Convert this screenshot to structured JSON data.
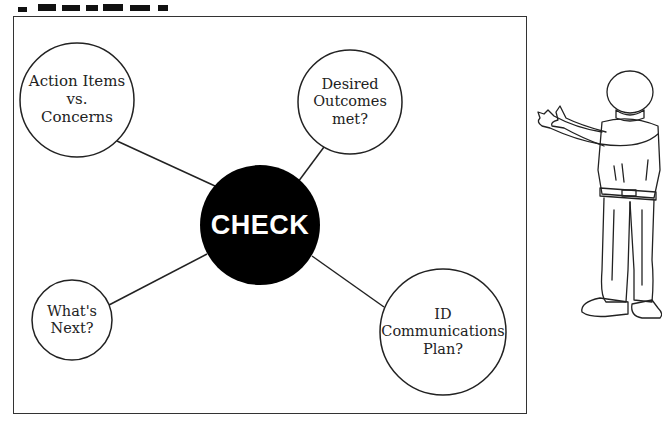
{
  "diagram": {
    "center": {
      "label": "CHECK",
      "fill": "#000000",
      "text_color": "#ffffff"
    },
    "nodes": [
      {
        "id": "action-items",
        "lines": [
          "Action Items",
          "vs.",
          "Concerns"
        ]
      },
      {
        "id": "desired-outcomes",
        "lines": [
          "Desired",
          "Outcomes",
          "met?"
        ]
      },
      {
        "id": "whats-next",
        "lines": [
          "What's",
          "Next?"
        ]
      },
      {
        "id": "id-communications",
        "lines": [
          "ID",
          "Communications",
          "Plan?"
        ]
      }
    ],
    "stroke_color": "#222222"
  },
  "illustration": {
    "icon": "pointing-person-sketch-icon"
  }
}
